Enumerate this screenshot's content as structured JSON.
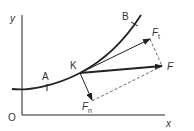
{
  "diagram": {
    "labels": {
      "y_axis": "y",
      "x_axis": "x",
      "origin": "O",
      "point_a": "A",
      "point_b": "B",
      "point_k": "K",
      "force_f": "F",
      "force_ft": "F",
      "force_ft_sub": "t",
      "force_fn": "F",
      "force_fn_sub": "n"
    },
    "colors": {
      "line": "#222222",
      "text": "#333333"
    }
  }
}
